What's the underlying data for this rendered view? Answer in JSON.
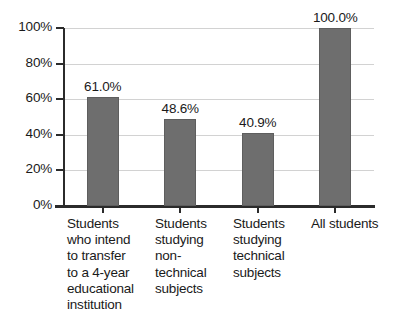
{
  "chart_data": {
    "type": "bar",
    "title": "",
    "xlabel": "",
    "ylabel": "",
    "ylim": [
      0,
      100
    ],
    "grid": true,
    "legend": "none",
    "orientation": "vertical",
    "bar_color": "#6e6e6e",
    "gridline_color": "#d2d2d2",
    "axis_color": "#2b2b2b",
    "text_color": "#1a1a1a",
    "background_color": "#ffffff",
    "categories": [
      "Students who intend to transfer to a 4-year educational institution",
      "Students studying non-technical subjects",
      "Students studying technical subjects",
      "All students"
    ],
    "category_lines": [
      [
        "Students",
        "who intend",
        "to transfer",
        "to a 4-year",
        "educational",
        "institution"
      ],
      [
        "Students",
        "studying",
        "non-",
        "technical",
        "subjects"
      ],
      [
        "Students",
        "studying",
        "technical",
        "subjects"
      ],
      [
        "All students"
      ]
    ],
    "values": [
      61.0,
      48.6,
      40.9,
      100.0
    ],
    "value_labels": [
      "61.0%",
      "48.6%",
      "40.9%",
      "100.0%"
    ],
    "y_ticks": [
      0,
      20,
      40,
      60,
      80,
      100
    ],
    "y_tick_labels": [
      "0%",
      "20%",
      "40%",
      "60%",
      "80%",
      "100%"
    ]
  }
}
